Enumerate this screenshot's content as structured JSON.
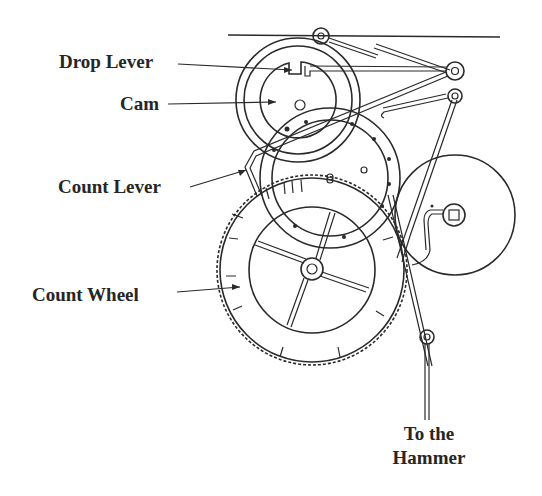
{
  "diagram": {
    "title": "",
    "labels": [
      {
        "id": "drop-lever",
        "text": "Drop Lever"
      },
      {
        "id": "cam",
        "text": "Cam"
      },
      {
        "id": "count-lever",
        "text": "Count Lever"
      },
      {
        "id": "count-wheel",
        "text": "Count Wheel"
      },
      {
        "id": "to-hammer-line1",
        "text": "To the"
      },
      {
        "id": "to-hammer-line2",
        "text": "Hammer"
      }
    ],
    "colors": {
      "ink": "#2a2a2a",
      "text": "#262626",
      "background": "#ffffff"
    }
  }
}
